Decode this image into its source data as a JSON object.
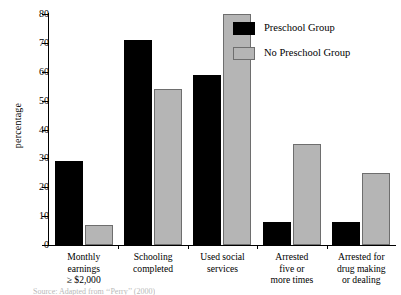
{
  "chart_data": {
    "type": "bar",
    "title": "",
    "xlabel": "",
    "ylabel": "percentage",
    "ylim": [
      0,
      80
    ],
    "yticks": [
      0,
      10,
      20,
      30,
      40,
      50,
      60,
      70,
      80
    ],
    "grid": false,
    "legend_position": "top-right",
    "categories": [
      "Monthly earnings ≥ $2,000",
      "Schooling completed",
      "Used social services",
      "Arrested five or more times",
      "Arrested for drug making or dealing"
    ],
    "category_lines": [
      [
        "Monthly",
        "earnings",
        "≥ $2,000"
      ],
      [
        "Schooling",
        "completed"
      ],
      [
        "Used social",
        "services"
      ],
      [
        "Arrested",
        "five or",
        "more times"
      ],
      [
        "Arrested for",
        "drug making",
        "or dealing"
      ]
    ],
    "series": [
      {
        "name": "Preschool Group",
        "color": "#000000",
        "values": [
          29,
          71,
          59,
          8,
          8
        ]
      },
      {
        "name": "No Preschool Group",
        "color": "#b5b5b5",
        "values": [
          7,
          54,
          80,
          35,
          25
        ]
      }
    ]
  },
  "legend": {
    "items": [
      {
        "label": "Preschool Group",
        "swatch": "dark"
      },
      {
        "label": "No Preschool Group",
        "swatch": "light"
      }
    ]
  },
  "caption_cut": "Source: Adapted from ‘‘Perry’’ (2000)"
}
